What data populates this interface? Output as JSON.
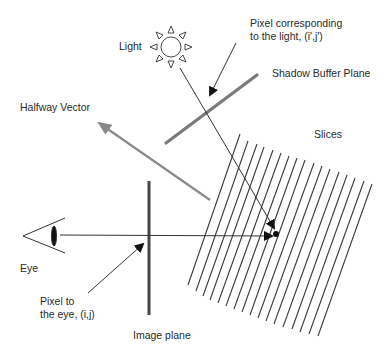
{
  "labels": {
    "light": "Light",
    "pixel_light_line1": "Pixel corresponding",
    "pixel_light_line2": "to the light, (i',j')",
    "shadow_buffer_plane": "Shadow Buffer Plane",
    "halfway_vector": "Halfway Vector",
    "slices": "Slices",
    "eye": "Eye",
    "pixel_eye_line1": "Pixel to",
    "pixel_eye_line2": "the eye, (i,j)",
    "image_plane": "Image plane"
  },
  "icons": {
    "light": "sun-icon",
    "eye": "eye-icon"
  },
  "colors": {
    "line_dark": "#333333",
    "line_gray": "#8a8a8a",
    "plane_dark": "#444444"
  },
  "geometry": {
    "slice_count": 18
  }
}
